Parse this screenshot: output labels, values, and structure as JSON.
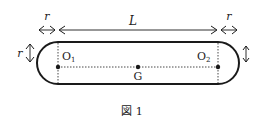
{
  "figure": {
    "caption": "図 1",
    "labels": {
      "length": "L",
      "radius_left": "r",
      "radius_right": "r",
      "radius_side": "r",
      "left_center": "O",
      "left_center_sub": "1",
      "right_center": "O",
      "right_center_sub": "2",
      "center_of_mass": "G"
    },
    "colors": {
      "stroke": "#1a1a1a",
      "background": "#ffffff"
    }
  }
}
